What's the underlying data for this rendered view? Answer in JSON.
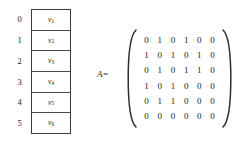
{
  "figure": {
    "name": "graph-adjacency-figure"
  },
  "vertex_table": {
    "indices": [
      "0",
      "1",
      "2",
      "3",
      "4",
      "5"
    ],
    "vertices": [
      {
        "base": "v",
        "sub": "1"
      },
      {
        "base": "v",
        "sub": "2"
      },
      {
        "base": "v",
        "sub": "3"
      },
      {
        "base": "v",
        "sub": "4"
      },
      {
        "base": "v",
        "sub": "5"
      },
      {
        "base": "v",
        "sub": "6"
      }
    ]
  },
  "matrix": {
    "label": "A=",
    "rows": [
      [
        "0",
        "1",
        "0",
        "1",
        "0",
        "0"
      ],
      [
        "1",
        "0",
        "1",
        "0",
        "1",
        "0"
      ],
      [
        "0",
        "1",
        "0",
        "1",
        "1",
        "0"
      ],
      [
        "1",
        "0",
        "1",
        "0",
        "0",
        "0"
      ],
      [
        "0",
        "1",
        "1",
        "0",
        "0",
        "0"
      ],
      [
        "0",
        "0",
        "0",
        "0",
        "0",
        "0"
      ]
    ]
  },
  "colors": {
    "background": "#ffffff",
    "text": "#222222",
    "table_border": "#3a3a3a",
    "bracket": "#2d2d2d"
  }
}
